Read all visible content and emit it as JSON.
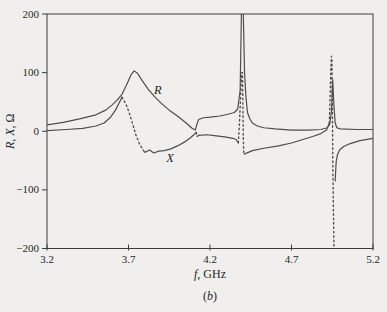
{
  "figure": {
    "background": "#f0efed",
    "frame_color": "#3c3c3c",
    "curve_color": "#4d4d4d",
    "text_color": "#262626",
    "caption": "(b)",
    "caption_parts": [
      {
        "text": "(",
        "italic": false
      },
      {
        "text": "b",
        "italic": true
      },
      {
        "text": ")",
        "italic": false
      }
    ]
  },
  "chart_data": {
    "type": "line",
    "title": "",
    "xlabel": "f, GHz",
    "xlabel_parts": [
      {
        "text": "f",
        "italic": true
      },
      {
        "text": ", GHz",
        "italic": false
      }
    ],
    "ylabel": "R, X, Ω",
    "ylabel_parts": [
      {
        "text": "R",
        "italic": true
      },
      {
        "text": ", ",
        "italic": false
      },
      {
        "text": "X",
        "italic": true
      },
      {
        "text": ", Ω",
        "italic": false
      }
    ],
    "xlim": [
      3.2,
      5.2
    ],
    "ylim": [
      -200,
      200
    ],
    "x_ticks": [
      3.2,
      3.7,
      4.2,
      4.7,
      5.2
    ],
    "x_tick_labels": [
      "3.2",
      "3.7",
      "4.2",
      "4.7",
      "5.2"
    ],
    "y_ticks": [
      200,
      100,
      0,
      -100,
      -200
    ],
    "y_tick_labels": [
      "200",
      "100",
      "0",
      "−100",
      "−200"
    ],
    "grid": false,
    "legend": "inline curve labels",
    "series": [
      {
        "name": "R",
        "label": {
          "text": "R",
          "f": 3.88,
          "v": 70
        },
        "segments": [
          {
            "style": "solid",
            "points": [
              [
                3.2,
                11
              ],
              [
                3.3,
                15
              ],
              [
                3.4,
                21
              ],
              [
                3.5,
                28
              ],
              [
                3.56,
                36
              ],
              [
                3.6,
                45
              ],
              [
                3.63,
                53
              ],
              [
                3.66,
                63
              ],
              [
                3.69,
                80
              ],
              [
                3.715,
                96
              ],
              [
                3.735,
                103
              ],
              [
                3.755,
                99
              ],
              [
                3.78,
                88
              ],
              [
                3.82,
                72
              ],
              [
                3.86,
                59
              ],
              [
                3.9,
                48
              ],
              [
                3.95,
                36
              ],
              [
                4.0,
                26
              ],
              [
                4.05,
                15
              ],
              [
                4.09,
                5
              ],
              [
                4.11,
                2
              ],
              [
                4.12,
                12
              ],
              [
                4.13,
                20
              ],
              [
                4.16,
                23
              ],
              [
                4.2,
                24
              ],
              [
                4.26,
                26
              ],
              [
                4.31,
                29
              ],
              [
                4.35,
                32
              ],
              [
                4.37,
                38
              ],
              [
                4.385,
                70
              ],
              [
                4.393,
                205
              ],
              [
                4.404,
                205
              ],
              [
                4.412,
                100
              ],
              [
                4.42,
                60
              ],
              [
                4.43,
                32
              ],
              [
                4.445,
                21
              ],
              [
                4.46,
                14
              ],
              [
                4.49,
                9
              ],
              [
                4.53,
                6
              ],
              [
                4.6,
                4
              ],
              [
                4.7,
                2
              ],
              [
                4.8,
                2
              ],
              [
                4.88,
                3
              ],
              [
                4.92,
                6
              ],
              [
                4.935,
                12
              ],
              [
                4.945,
                35
              ],
              [
                4.953,
                88
              ],
              [
                4.96,
                45
              ],
              [
                4.968,
                14
              ],
              [
                4.978,
                6
              ],
              [
                5.0,
                4
              ],
              [
                5.1,
                3
              ],
              [
                5.2,
                3
              ]
            ]
          }
        ]
      },
      {
        "name": "X",
        "label": {
          "text": "X",
          "f": 3.955,
          "v": -46
        },
        "segments": [
          {
            "style": "solid",
            "points": [
              [
                3.2,
                1
              ],
              [
                3.32,
                3
              ],
              [
                3.42,
                5
              ],
              [
                3.5,
                9
              ],
              [
                3.55,
                14
              ],
              [
                3.59,
                24
              ],
              [
                3.62,
                36
              ],
              [
                3.64,
                47
              ],
              [
                3.66,
                58
              ]
            ]
          },
          {
            "style": "dashed",
            "points": [
              [
                3.66,
                58
              ],
              [
                3.685,
                46
              ],
              [
                3.705,
                31
              ],
              [
                3.725,
                13
              ],
              [
                3.745,
                -6
              ],
              [
                3.765,
                -20
              ],
              [
                3.785,
                -30
              ],
              [
                3.8,
                -36
              ]
            ]
          },
          {
            "style": "solid",
            "points": [
              [
                3.8,
                -36
              ],
              [
                3.83,
                -32
              ],
              [
                3.855,
                -37
              ],
              [
                3.885,
                -34
              ],
              [
                3.92,
                -33
              ],
              [
                3.96,
                -30
              ],
              [
                4.0,
                -25
              ],
              [
                4.04,
                -19
              ],
              [
                4.08,
                -11
              ],
              [
                4.105,
                -5
              ],
              [
                4.115,
                -2
              ]
            ]
          },
          {
            "style": "dashed",
            "points": [
              [
                4.115,
                -2
              ],
              [
                4.121,
                -9
              ],
              [
                4.13,
                -7
              ]
            ]
          },
          {
            "style": "solid",
            "points": [
              [
                4.13,
                -7
              ],
              [
                4.18,
                -6
              ],
              [
                4.24,
                -8
              ],
              [
                4.3,
                -10
              ],
              [
                4.34,
                -12
              ],
              [
                4.36,
                -14
              ],
              [
                4.372,
                -19
              ]
            ]
          },
          {
            "style": "dashed",
            "points": [
              [
                4.374,
                -20
              ],
              [
                4.381,
                15
              ],
              [
                4.388,
                60
              ],
              [
                4.394,
                100
              ],
              [
                4.399,
                100
              ],
              [
                4.402,
                45
              ],
              [
                4.404,
                -5
              ],
              [
                4.407,
                -40
              ]
            ]
          },
          {
            "style": "solid",
            "points": [
              [
                4.41,
                -39
              ],
              [
                4.46,
                -33
              ],
              [
                4.53,
                -29
              ],
              [
                4.62,
                -25
              ],
              [
                4.7,
                -20
              ],
              [
                4.77,
                -14
              ],
              [
                4.83,
                -9
              ],
              [
                4.88,
                -4
              ],
              [
                4.915,
                2
              ],
              [
                4.932,
                14
              ]
            ]
          },
          {
            "style": "dashed",
            "points": [
              [
                4.932,
                14
              ],
              [
                4.938,
                70
              ],
              [
                4.942,
                110
              ],
              [
                4.945,
                128
              ],
              [
                4.948,
                120
              ],
              [
                4.95,
                60
              ],
              [
                4.952,
                0
              ],
              [
                4.954,
                -70
              ],
              [
                4.957,
                -130
              ],
              [
                4.961,
                -205
              ]
            ]
          },
          {
            "style": "solid",
            "points": [
              [
                4.968,
                -85
              ],
              [
                4.974,
                -52
              ],
              [
                4.982,
                -40
              ],
              [
                4.995,
                -32
              ],
              [
                5.02,
                -26
              ],
              [
                5.06,
                -21
              ],
              [
                5.12,
                -16
              ],
              [
                5.2,
                -12
              ]
            ]
          }
        ]
      }
    ]
  }
}
